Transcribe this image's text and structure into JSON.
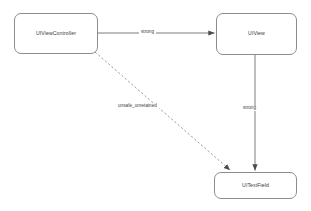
{
  "diagram": {
    "background_color": "#ffffff",
    "node_border_color": "#8c8c8c",
    "edge_color": "#6e6e6e",
    "text_color": "#3a3a3a",
    "nodes": [
      {
        "id": "uiviewcontroller",
        "label": "UIViewController"
      },
      {
        "id": "uiview",
        "label": "UIView"
      },
      {
        "id": "uitextfield",
        "label": "UITextField"
      }
    ],
    "edges": [
      {
        "id": "vc-to-view",
        "from": "uiviewcontroller",
        "to": "uiview",
        "label": "strong",
        "style": "solid",
        "arrow": "filled-triangle"
      },
      {
        "id": "view-to-textfield",
        "from": "uiview",
        "to": "uitextfield",
        "label": "strong",
        "style": "solid",
        "arrow": "filled-triangle"
      },
      {
        "id": "vc-to-textfield",
        "from": "uiviewcontroller",
        "to": "uitextfield",
        "label": "unsafe_unretained",
        "style": "dashed",
        "arrow": "filled-triangle"
      }
    ]
  }
}
